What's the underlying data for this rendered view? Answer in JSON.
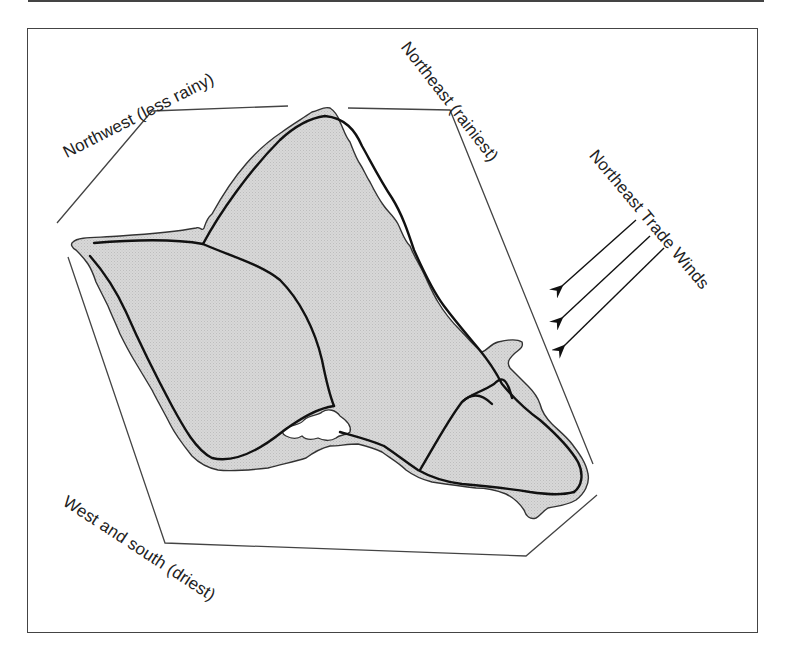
{
  "figure": {
    "type": "map",
    "colors": {
      "land_fill": "#d4d4d4",
      "coastline": "#333333",
      "road": "#111111",
      "boundary_lines": "#444444",
      "text": "#222222"
    }
  },
  "labels": {
    "northwest": "Northwest (less rainy)",
    "northeast": "Northeast (rainiest)",
    "trade_winds": "Northeast Trade Winds",
    "west_south": "West and south (driest)"
  },
  "legend_elements": {
    "wind_arrows": {
      "count": 3,
      "direction": "southwest",
      "icon": "arrow-icon"
    }
  }
}
